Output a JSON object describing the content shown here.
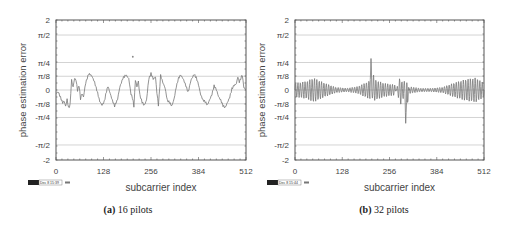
{
  "chart_data": [
    {
      "type": "line",
      "title": "",
      "caption_label": "(a)",
      "caption_text": "16 pilots",
      "xlabel": "subcarrier index",
      "ylabel": "phase estimation error",
      "xlim": [
        0,
        512
      ],
      "ylim": [
        -2,
        2
      ],
      "xticks": [
        0,
        128,
        256,
        384,
        512
      ],
      "xtick_labels": [
        "0",
        "128",
        "256",
        "384",
        "512"
      ],
      "yticks": [
        2,
        1.5708,
        0.7854,
        0.3927,
        0,
        -0.3927,
        -0.7854,
        -1.5708,
        -2
      ],
      "ytick_labels": [
        "2",
        "π/2",
        "π/4",
        "π/8",
        "0",
        "-π/8",
        "-π/4",
        "-π/2",
        "-2"
      ],
      "grid": true,
      "stamp": "GMT Dec 8 15:39",
      "outlier": {
        "x": 207,
        "y": 0.95
      },
      "series": [
        {
          "name": "phase error (16 pilots)",
          "x": [
            0,
            6,
            12,
            18,
            22,
            26,
            30,
            34,
            38,
            42,
            46,
            50,
            54,
            58,
            62,
            66,
            70,
            74,
            80,
            88,
            96,
            104,
            112,
            118,
            124,
            130,
            136,
            140,
            146,
            152,
            158,
            166,
            172,
            180,
            188,
            196,
            202,
            206,
            210,
            214,
            218,
            222,
            226,
            232,
            238,
            244,
            250,
            256,
            262,
            268,
            272,
            276,
            282,
            288,
            294,
            300,
            306,
            312,
            318,
            324,
            330,
            336,
            342,
            348,
            356,
            364,
            372,
            378,
            384,
            390,
            396,
            402,
            408,
            414,
            420,
            426,
            432,
            438,
            444,
            450,
            456,
            462,
            468,
            474,
            480,
            486,
            490,
            494,
            498,
            502,
            506,
            512
          ],
          "values": [
            -0.1,
            -0.05,
            -0.2,
            -0.35,
            -0.3,
            -0.45,
            -0.25,
            -0.5,
            -0.4,
            0.3,
            0.1,
            0.35,
            0.3,
            0.0,
            0.15,
            -0.25,
            -0.1,
            -0.2,
            0.2,
            0.45,
            0.4,
            0.2,
            -0.1,
            -0.35,
            -0.45,
            -0.35,
            -0.05,
            0.1,
            -0.1,
            -0.3,
            -0.45,
            -0.25,
            0.1,
            0.35,
            0.45,
            0.35,
            -0.1,
            -0.2,
            -0.45,
            0.3,
            0.1,
            0.25,
            -0.15,
            -0.35,
            -0.45,
            -0.3,
            0.3,
            0.45,
            0.3,
            0.35,
            -0.1,
            -0.45,
            0.4,
            0.2,
            0.05,
            -0.3,
            -0.35,
            -0.45,
            -0.25,
            0.1,
            0.35,
            0.45,
            0.35,
            0.2,
            -0.05,
            0.3,
            0.45,
            0.35,
            0.15,
            -0.15,
            -0.3,
            -0.35,
            -0.45,
            -0.3,
            -0.15,
            0.1,
            0.0,
            -0.2,
            -0.3,
            -0.45,
            -0.5,
            -0.35,
            -0.2,
            0.05,
            0.15,
            0.2,
            0.4,
            0.25,
            0.35,
            0.45,
            0.1,
            0.0
          ]
        }
      ]
    },
    {
      "type": "line",
      "title": "",
      "caption_label": "(b)",
      "caption_text": "32 pilots",
      "xlabel": "subcarrier index",
      "ylabel": "phase estimation error",
      "xlim": [
        0,
        512
      ],
      "ylim": [
        -2,
        2
      ],
      "xticks": [
        0,
        128,
        256,
        384,
        512
      ],
      "xtick_labels": [
        "0",
        "128",
        "256",
        "384",
        "512"
      ],
      "yticks": [
        2,
        1.5708,
        0.7854,
        0.3927,
        0,
        -0.3927,
        -0.7854,
        -1.5708,
        -2
      ],
      "ytick_labels": [
        "2",
        "π/2",
        "π/4",
        "π/8",
        "0",
        "-π/8",
        "-π/4",
        "-π/2",
        "-2"
      ],
      "grid": true,
      "stamp": "GMT Dec 8 15:44",
      "series": [
        {
          "name": "phase error (32 pilots)",
          "description": "oscillating ripple, amplitude ~0.3 near edges and pilots, ~0.05 mid-bands; spike to ~+0.9 at x≈206, spike to ~-0.95 at x≈300",
          "x": [
            0,
            32,
            50,
            80,
            110,
            140,
            170,
            200,
            206,
            215,
            240,
            270,
            300,
            310,
            340,
            370,
            400,
            430,
            460,
            490,
            512
          ],
          "envelope": [
            0.2,
            0.25,
            0.35,
            0.2,
            0.08,
            0.05,
            0.1,
            0.25,
            0.9,
            0.3,
            0.2,
            0.15,
            -0.95,
            0.1,
            0.05,
            0.05,
            0.08,
            0.2,
            0.3,
            0.35,
            0.2
          ]
        }
      ]
    }
  ]
}
